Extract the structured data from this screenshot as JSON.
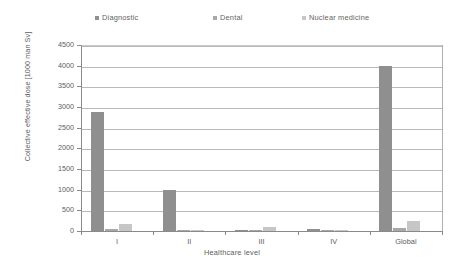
{
  "chart_data": {
    "type": "bar",
    "title": "",
    "xlabel": "Healthcare level",
    "ylabel": "Collective effective dose [1000 man Sv]",
    "categories": [
      "I",
      "II",
      "III",
      "IV",
      "Global"
    ],
    "series": [
      {
        "name": "Diagnostic",
        "color": "#8f8f8f",
        "values": [
          2870,
          1000,
          20,
          50,
          4000
        ]
      },
      {
        "name": "Dental",
        "color": "#a8a8a8",
        "values": [
          60,
          10,
          5,
          5,
          70
        ]
      },
      {
        "name": "Nuclear medicine",
        "color": "#c6c6c6",
        "values": [
          160,
          15,
          100,
          5,
          250
        ]
      }
    ],
    "ylim": [
      0,
      4500
    ],
    "yticks": [
      0,
      500,
      1000,
      1500,
      2000,
      2500,
      3000,
      3500,
      4000,
      4500
    ],
    "ytick_labels": [
      "0",
      "500",
      "1000",
      "1500",
      "2000",
      "2500",
      "3000",
      "3500",
      "4000",
      "4500"
    ],
    "grid": true,
    "legend_position": "top"
  }
}
